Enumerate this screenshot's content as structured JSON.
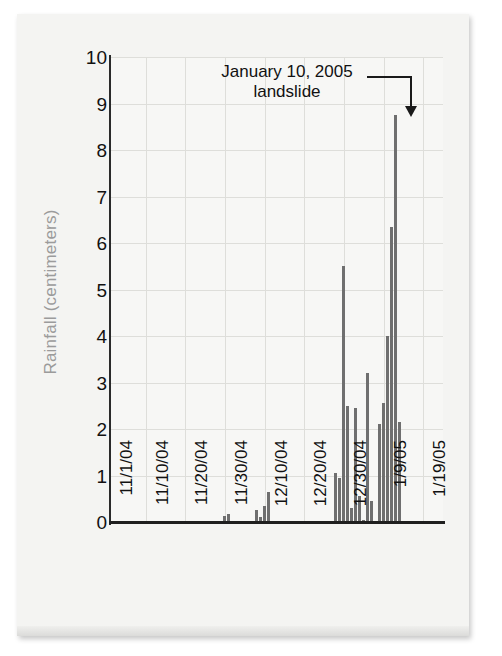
{
  "figure": {
    "y_axis_title": "Rainfall (centimeters)",
    "annotation_line1": "January 10, 2005",
    "annotation_line2": "landslide",
    "accent_color": "#6f6f6f",
    "axis_color": "#1f1f1f",
    "grid_color": "#dededa",
    "label_color": "#9b9b9b"
  },
  "chart_data": {
    "type": "bar",
    "title": "",
    "xlabel": "",
    "ylabel": "Rainfall (centimeters)",
    "ylim": [
      0,
      10
    ],
    "xlim": [
      "11/1/04",
      "1/24/05"
    ],
    "grid": true,
    "legend": "none",
    "ytick_labels": [
      "10",
      "9",
      "8",
      "7",
      "6",
      "5",
      "4",
      "3",
      "2",
      "1",
      "0"
    ],
    "ytick_values": [
      10,
      9,
      8,
      7,
      6,
      5,
      4,
      3,
      2,
      1,
      0
    ],
    "xtick_labels": [
      "11/1/04",
      "11/10/04",
      "11/20/04",
      "11/30/04",
      "12/10/04",
      "12/20/04",
      "12/30/04",
      "1/9/05",
      "1/19/05"
    ],
    "xtick_day_offsets": [
      0,
      9,
      19,
      29,
      39,
      49,
      59,
      69,
      79
    ],
    "annotations": [
      {
        "text": "January 10, 2005 landslide",
        "target_day_offset": 70,
        "target_value": 8.75,
        "style": "leader-line-with-arrow"
      }
    ],
    "units": "centimeters",
    "bar_color": "#6f6f6f",
    "series_name": "Daily rainfall",
    "points": [
      {
        "day": 29,
        "value": 0.12
      },
      {
        "day": 30,
        "value": 0.18
      },
      {
        "day": 37,
        "value": 0.25
      },
      {
        "day": 38,
        "value": 0.1
      },
      {
        "day": 39,
        "value": 0.35
      },
      {
        "day": 40,
        "value": 0.65
      },
      {
        "day": 57,
        "value": 1.05
      },
      {
        "day": 58,
        "value": 0.95
      },
      {
        "day": 59,
        "value": 5.5
      },
      {
        "day": 60,
        "value": 2.5
      },
      {
        "day": 61,
        "value": 0.3
      },
      {
        "day": 62,
        "value": 2.45
      },
      {
        "day": 63,
        "value": 0.55
      },
      {
        "day": 64,
        "value": 0.05
      },
      {
        "day": 65,
        "value": 3.2
      },
      {
        "day": 66,
        "value": 0.45
      },
      {
        "day": 68,
        "value": 2.1
      },
      {
        "day": 69,
        "value": 2.55
      },
      {
        "day": 70,
        "value": 4.0
      },
      {
        "day": 71,
        "value": 6.35
      },
      {
        "day": 72,
        "value": 8.75
      },
      {
        "day": 73,
        "value": 2.15
      }
    ]
  }
}
